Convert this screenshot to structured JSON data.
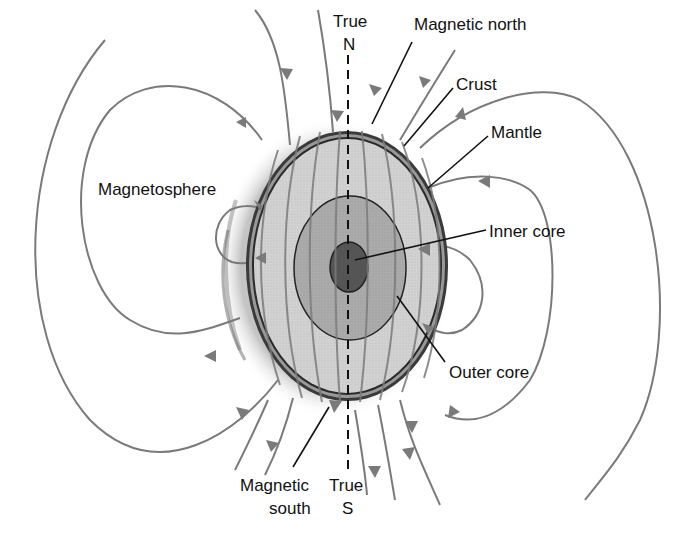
{
  "diagram": {
    "labels": {
      "true_north_line1": "True",
      "true_north_line2": "N",
      "magnetic_north": "Magnetic north",
      "crust": "Crust",
      "mantle": "Mantle",
      "magnetosphere": "Magnetosphere",
      "inner_core": "Inner core",
      "outer_core": "Outer core",
      "magnetic_south_line1": "Magnetic",
      "magnetic_south_line2": "south",
      "true_south_line1": "True",
      "true_south_line2": "S"
    },
    "layers": [
      {
        "name": "Crust",
        "color": "#555555"
      },
      {
        "name": "Mantle",
        "color": "#cfcfcf"
      },
      {
        "name": "Outer core",
        "color": "#a8a8a8"
      },
      {
        "name": "Inner core",
        "color": "#5a5a5a"
      }
    ],
    "colors": {
      "field_lines": "#7a7a7a",
      "leader_lines": "#111111",
      "axis_dash": "#111111",
      "background": "#ffffff"
    }
  }
}
